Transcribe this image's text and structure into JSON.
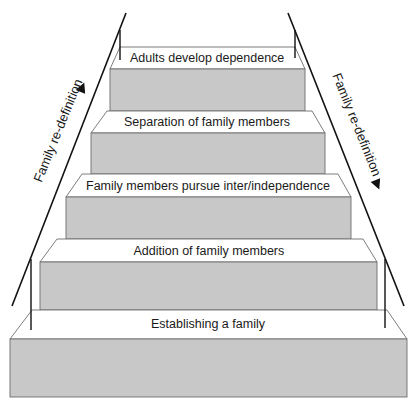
{
  "diagram": {
    "type": "staircase",
    "colors": {
      "tread": "#ffffff",
      "riser": "#c8c8c8",
      "edge": "#6e6e6e",
      "line": "#111111",
      "text": "#1a1a1a"
    },
    "steps": [
      {
        "label": "Adults develop dependence",
        "tread_back": {
          "y": 47,
          "x1": 120,
          "x2": 295
        },
        "tread_front": {
          "y": 69,
          "x1": 110,
          "x2": 305
        },
        "riser_bottom": 111,
        "label_pos": {
          "x": 207,
          "y": 52
        }
      },
      {
        "label": "Separation of family members",
        "tread_back": {
          "y": 111,
          "x1": 107,
          "x2": 312
        },
        "tread_front": {
          "y": 133,
          "x1": 91,
          "x2": 325
        },
        "riser_bottom": 174,
        "label_pos": {
          "x": 207,
          "y": 116
        }
      },
      {
        "label": "Family members pursue inter/independence",
        "tread_back": {
          "y": 174,
          "x1": 82,
          "x2": 338
        },
        "tread_front": {
          "y": 197,
          "x1": 66,
          "x2": 351
        },
        "riser_bottom": 239,
        "label_pos": {
          "x": 208,
          "y": 180
        }
      },
      {
        "label": "Addition of family members",
        "tread_back": {
          "y": 239,
          "x1": 57,
          "x2": 363
        },
        "tread_front": {
          "y": 262,
          "x1": 40,
          "x2": 377
        },
        "riser_bottom": 310,
        "label_pos": {
          "x": 209,
          "y": 245
        }
      },
      {
        "label": "Establishing a family",
        "tread_back": {
          "y": 310,
          "x1": 32,
          "x2": 387
        },
        "tread_front": {
          "y": 339,
          "x1": 10,
          "x2": 407
        },
        "riser_bottom": 397,
        "label_pos": {
          "x": 208,
          "y": 318
        }
      }
    ],
    "rails": {
      "left_diagonal": {
        "x1": 126,
        "y1": 13,
        "x2": 12,
        "y2": 306
      },
      "right_diagonal": {
        "x1": 288,
        "y1": 13,
        "x2": 404,
        "y2": 306
      },
      "left_posts": [
        {
          "x": 120,
          "y1": 30,
          "y2": 60
        },
        {
          "x": 31,
          "y1": 259,
          "y2": 330
        }
      ],
      "right_posts": [
        {
          "x": 295,
          "y1": 30,
          "y2": 58
        },
        {
          "x": 385,
          "y1": 259,
          "y2": 328
        }
      ]
    },
    "side_labels": {
      "left": {
        "text": "Family re-definition",
        "arrow": "up",
        "cx": 58,
        "cy": 130,
        "angle": -68
      },
      "right": {
        "text": "Family re-definition",
        "arrow": "down",
        "cx": 357,
        "cy": 124,
        "angle": 68
      }
    },
    "arrows": {
      "left": {
        "x": 82,
        "y": 88,
        "direction": "up"
      },
      "right": {
        "x": 377,
        "y": 184,
        "direction": "down"
      }
    }
  }
}
